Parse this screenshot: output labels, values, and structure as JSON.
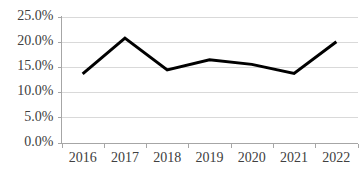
{
  "chart_data": {
    "type": "line",
    "title": "",
    "subtitle": "",
    "xlabel": "",
    "ylabel": "",
    "categories": [
      "2016",
      "2017",
      "2018",
      "2019",
      "2020",
      "2021",
      "2022"
    ],
    "x": [
      2016,
      2017,
      2018,
      2019,
      2020,
      2021,
      2022
    ],
    "values": [
      13.6,
      20.7,
      14.4,
      16.4,
      15.5,
      13.7,
      20.0
    ],
    "series": [
      {
        "name": "",
        "values": [
          13.6,
          20.7,
          14.4,
          16.4,
          15.5,
          13.7,
          20.0
        ]
      }
    ],
    "ylim": [
      0,
      25
    ],
    "y_ticks": [
      0,
      5,
      10,
      15,
      20,
      25
    ],
    "y_tick_labels": [
      "0.0%",
      "5.0%",
      "10.0%",
      "15.0%",
      "20.0%",
      "25.0%"
    ],
    "x_tick_labels": [
      "2016",
      "2017",
      "2018",
      "2019",
      "2020",
      "2021",
      "2022"
    ],
    "grid": true,
    "grid_axis": "y",
    "legend": false,
    "legend_position": "none",
    "annotations": [],
    "colors": {
      "series_line": "#000000",
      "gridline": "#d9d9d9",
      "axis": "#a6a6a6",
      "tick_label": "#404040",
      "background": "#ffffff"
    },
    "units": "percent"
  }
}
